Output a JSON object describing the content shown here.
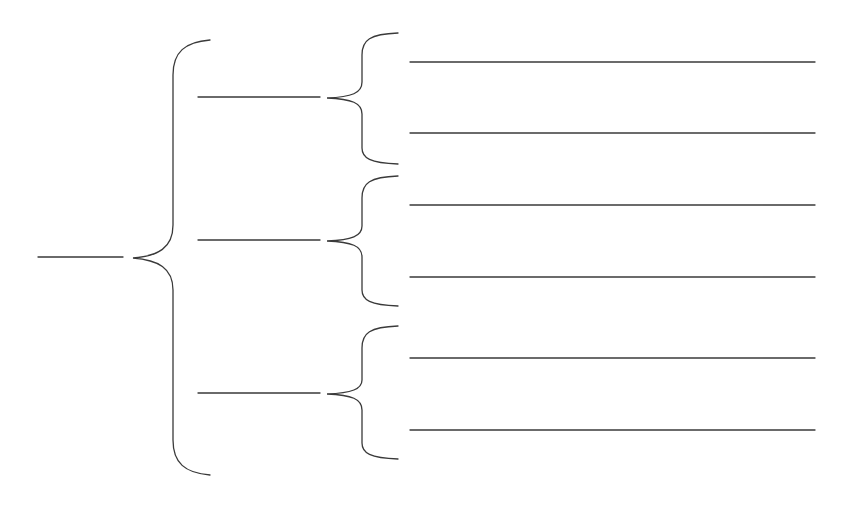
{
  "diagram": {
    "type": "bracket-tree",
    "title": "",
    "stroke_color": "#3a3a3a",
    "background_color": "#ffffff",
    "root": {
      "label": "",
      "children": [
        {
          "label": "",
          "children": [
            {
              "label": ""
            },
            {
              "label": ""
            }
          ]
        },
        {
          "label": "",
          "children": [
            {
              "label": ""
            },
            {
              "label": ""
            }
          ]
        },
        {
          "label": "",
          "children": [
            {
              "label": ""
            },
            {
              "label": ""
            }
          ]
        }
      ]
    }
  }
}
